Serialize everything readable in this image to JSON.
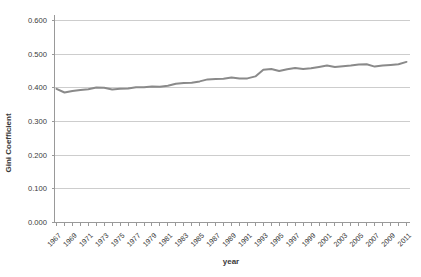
{
  "page": {
    "background": "#ffffff"
  },
  "chart_data": {
    "type": "line",
    "title": "",
    "xlabel": "year",
    "ylabel": "Gini Coefficient",
    "legend": "none",
    "grid": true,
    "ylim": [
      0.0,
      0.6
    ],
    "ytick_interval": 0.1,
    "ytick_labels": [
      "0.000",
      "0.100",
      "0.200",
      "0.300",
      "0.400",
      "0.500",
      "0.600"
    ],
    "xtick_labels": [
      "1967",
      "1969",
      "1971",
      "1973",
      "1975",
      "1977",
      "1979",
      "1981",
      "1983",
      "1985",
      "1987",
      "1989",
      "1991",
      "1993",
      "1995",
      "1997",
      "1999",
      "2001",
      "2003",
      "2005",
      "2007",
      "2009",
      "2011"
    ],
    "x": [
      1967,
      1968,
      1969,
      1970,
      1971,
      1972,
      1973,
      1974,
      1975,
      1976,
      1977,
      1978,
      1979,
      1980,
      1981,
      1982,
      1983,
      1984,
      1985,
      1986,
      1987,
      1988,
      1989,
      1990,
      1991,
      1992,
      1993,
      1994,
      1995,
      1996,
      1997,
      1998,
      1999,
      2000,
      2001,
      2002,
      2003,
      2004,
      2005,
      2006,
      2007,
      2008,
      2009,
      2010,
      2011
    ],
    "y": [
      0.397,
      0.386,
      0.391,
      0.394,
      0.396,
      0.401,
      0.4,
      0.395,
      0.397,
      0.398,
      0.402,
      0.402,
      0.404,
      0.403,
      0.406,
      0.412,
      0.414,
      0.415,
      0.419,
      0.425,
      0.426,
      0.427,
      0.431,
      0.428,
      0.428,
      0.434,
      0.454,
      0.456,
      0.45,
      0.455,
      0.459,
      0.456,
      0.458,
      0.462,
      0.466,
      0.462,
      0.464,
      0.466,
      0.469,
      0.47,
      0.463,
      0.466,
      0.468,
      0.47,
      0.477
    ],
    "colors": {
      "line": "#8a8a8a",
      "grid": "#cdcdcd",
      "axis": "#999999",
      "text": "#3a3a3a",
      "background": "#ffffff"
    }
  }
}
